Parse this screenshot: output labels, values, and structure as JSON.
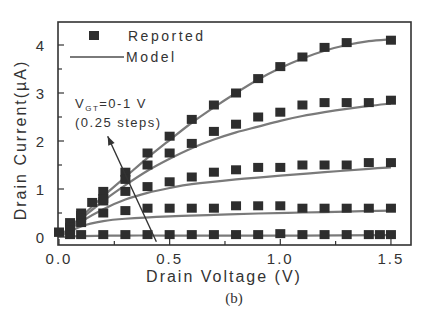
{
  "chart_data": {
    "type": "scatter",
    "title": "",
    "caption": "(b)",
    "xlabel": "Drain Voltage (V)",
    "ylabel": "Drain Current(µA)",
    "xlim": [
      0.0,
      1.6
    ],
    "ylim": [
      -0.15,
      4.5
    ],
    "xticks": [
      0.0,
      0.5,
      1.0,
      1.5
    ],
    "xtick_labels": [
      "0.0",
      "0.5",
      "1.0",
      "1.5"
    ],
    "yticks": [
      0,
      1,
      2,
      3,
      4
    ],
    "ytick_labels": [
      "0",
      "1",
      "2",
      "3",
      "4"
    ],
    "grid": false,
    "legend": {
      "position": "upper-left",
      "entries": [
        {
          "label": "Reported",
          "marker": "square"
        },
        {
          "label": "Model",
          "marker": "line"
        }
      ]
    },
    "annotation": {
      "line1": "V",
      "line1_sub": "GT",
      "line1_rest": "=0-1 V",
      "line2": "(0.25 steps)",
      "arrow": {
        "from": [
          0.44,
          -0.1
        ],
        "to": [
          0.22,
          2.1
        ]
      }
    },
    "series": [
      {
        "name": "VGT=1.0 V",
        "reported": {
          "x": [
            0.0,
            0.05,
            0.1,
            0.15,
            0.2,
            0.3,
            0.4,
            0.5,
            0.6,
            0.7,
            0.8,
            0.9,
            1.0,
            1.1,
            1.2,
            1.3,
            1.5
          ],
          "y": [
            0.1,
            0.3,
            0.5,
            0.72,
            0.95,
            1.35,
            1.75,
            2.1,
            2.45,
            2.75,
            3.0,
            3.3,
            3.55,
            3.75,
            3.95,
            4.05,
            4.1
          ]
        },
        "model": {
          "x": [
            0.0,
            0.1,
            0.2,
            0.3,
            0.4,
            0.5,
            0.6,
            0.7,
            0.8,
            0.9,
            1.0,
            1.1,
            1.2,
            1.3,
            1.4,
            1.5
          ],
          "y": [
            0.0,
            0.42,
            0.85,
            1.25,
            1.65,
            2.02,
            2.38,
            2.7,
            3.0,
            3.28,
            3.52,
            3.72,
            3.88,
            4.0,
            4.08,
            4.12
          ]
        }
      },
      {
        "name": "VGT=0.75 V",
        "reported": {
          "x": [
            0.0,
            0.1,
            0.2,
            0.3,
            0.4,
            0.5,
            0.6,
            0.7,
            0.8,
            0.9,
            1.0,
            1.1,
            1.2,
            1.3,
            1.4,
            1.5
          ],
          "y": [
            0.1,
            0.45,
            0.8,
            1.2,
            1.5,
            1.75,
            1.95,
            2.2,
            2.35,
            2.5,
            2.6,
            2.75,
            2.8,
            2.8,
            2.8,
            2.85
          ]
        },
        "model": {
          "x": [
            0.0,
            0.1,
            0.2,
            0.3,
            0.4,
            0.5,
            0.6,
            0.7,
            0.8,
            0.9,
            1.0,
            1.1,
            1.2,
            1.3,
            1.4,
            1.5
          ],
          "y": [
            0.0,
            0.38,
            0.75,
            1.08,
            1.38,
            1.63,
            1.85,
            2.03,
            2.18,
            2.3,
            2.42,
            2.52,
            2.6,
            2.67,
            2.73,
            2.78
          ]
        }
      },
      {
        "name": "VGT=0.5 V",
        "reported": {
          "x": [
            0.05,
            0.1,
            0.2,
            0.3,
            0.4,
            0.5,
            0.6,
            0.7,
            0.8,
            0.9,
            1.0,
            1.1,
            1.2,
            1.3,
            1.4,
            1.5
          ],
          "y": [
            0.2,
            0.4,
            0.75,
            0.95,
            1.05,
            1.15,
            1.25,
            1.35,
            1.4,
            1.45,
            1.45,
            1.5,
            1.5,
            1.5,
            1.55,
            1.55
          ]
        },
        "model": {
          "x": [
            0.0,
            0.1,
            0.2,
            0.3,
            0.4,
            0.5,
            0.6,
            0.8,
            1.0,
            1.2,
            1.4,
            1.5
          ],
          "y": [
            0.0,
            0.32,
            0.58,
            0.78,
            0.92,
            1.02,
            1.1,
            1.2,
            1.28,
            1.35,
            1.42,
            1.45
          ]
        }
      },
      {
        "name": "VGT=0.25 V",
        "reported": {
          "x": [
            0.05,
            0.1,
            0.2,
            0.3,
            0.4,
            0.5,
            0.6,
            0.7,
            0.8,
            0.9,
            1.0,
            1.1,
            1.2,
            1.3,
            1.4,
            1.5
          ],
          "y": [
            0.15,
            0.3,
            0.5,
            0.55,
            0.6,
            0.6,
            0.6,
            0.6,
            0.65,
            0.65,
            0.65,
            0.6,
            0.6,
            0.6,
            0.6,
            0.6
          ]
        },
        "model": {
          "x": [
            0.0,
            0.1,
            0.2,
            0.3,
            0.5,
            0.7,
            0.9,
            1.1,
            1.3,
            1.5
          ],
          "y": [
            0.0,
            0.22,
            0.33,
            0.38,
            0.43,
            0.46,
            0.49,
            0.51,
            0.53,
            0.55
          ]
        }
      },
      {
        "name": "VGT=0 V",
        "reported": {
          "x": [
            0.05,
            0.1,
            0.2,
            0.3,
            0.4,
            0.5,
            0.6,
            0.7,
            0.8,
            0.9,
            1.0,
            1.1,
            1.2,
            1.3,
            1.4,
            1.45,
            1.5
          ],
          "y": [
            0.05,
            0.05,
            0.05,
            0.05,
            0.05,
            0.05,
            0.05,
            0.05,
            0.05,
            0.05,
            0.07,
            0.05,
            0.05,
            0.05,
            0.05,
            0.05,
            0.05
          ]
        },
        "model": {
          "x": [
            0.0,
            0.1,
            0.3,
            0.5,
            0.8,
            1.1,
            1.5
          ],
          "y": [
            0.0,
            0.02,
            0.03,
            0.03,
            0.03,
            0.03,
            0.04
          ]
        }
      }
    ]
  },
  "colors": {
    "marker": "#2e2e2e",
    "model_line": "#7a7a7a",
    "axis": "#333333",
    "text": "#333333",
    "background": "#ffffff"
  }
}
